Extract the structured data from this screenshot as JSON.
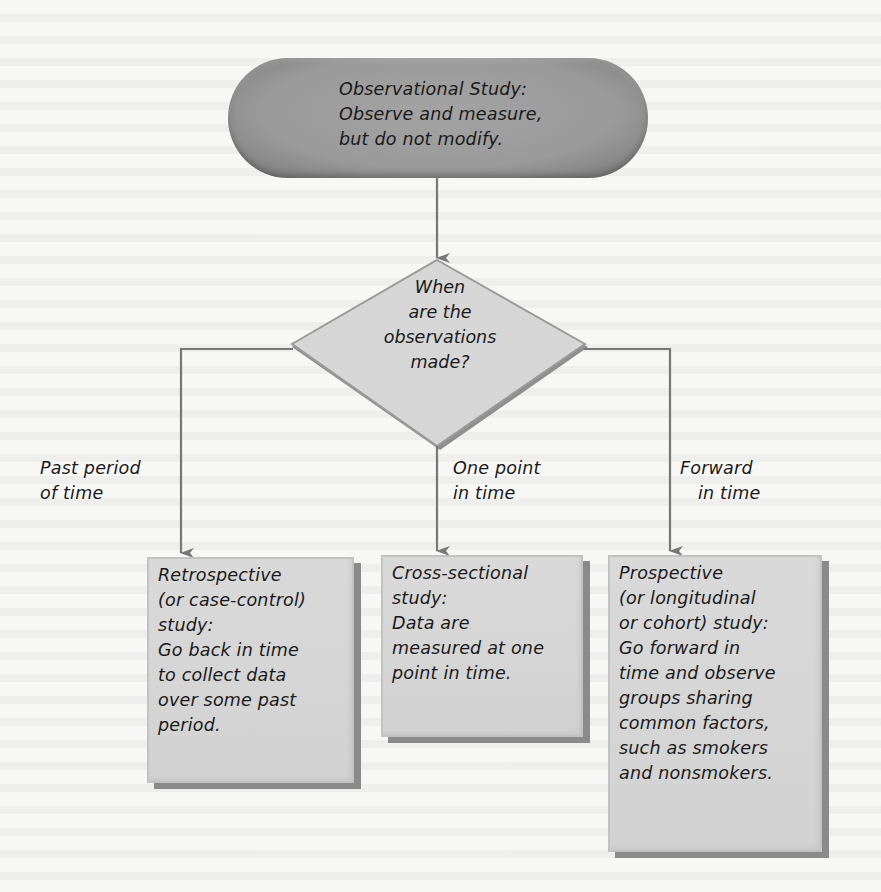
{
  "diagram": {
    "type": "flowchart",
    "root": {
      "title": "Observational Study:",
      "lines": [
        "Observe and measure,",
        "but do not modify."
      ]
    },
    "decision": {
      "lines": [
        "When",
        "are the",
        "observations",
        "made?"
      ]
    },
    "branches": [
      {
        "edge_label": [
          "Past period",
          "of time"
        ],
        "box": {
          "title_lines": [
            "Retrospective",
            "(or case-control)",
            "study:"
          ],
          "body_lines": [
            "Go back in time",
            "to collect data",
            "over some past",
            "period."
          ]
        }
      },
      {
        "edge_label": [
          "One point",
          "in time"
        ],
        "box": {
          "title_lines": [
            "Cross-sectional",
            "study:"
          ],
          "body_lines": [
            "Data are",
            "measured at one",
            "point in time."
          ]
        }
      },
      {
        "edge_label": [
          "Forward",
          "in time"
        ],
        "box": {
          "title_lines": [
            "Prospective",
            "(or longitudinal",
            "or cohort) study:"
          ],
          "body_lines": [
            "Go forward in",
            "time and observe",
            "groups sharing",
            "common factors,",
            "such as smokers",
            "and nonsmokers."
          ]
        }
      }
    ]
  },
  "colors": {
    "background": "#f7f7f6",
    "root_fill": "#9a9a9a",
    "decision_fill": "#d6d6d6",
    "box_fill": "#d4d4d4",
    "box_shadow": "#8a8a8a",
    "connector": "#777777",
    "text": "#1a1a1a"
  }
}
